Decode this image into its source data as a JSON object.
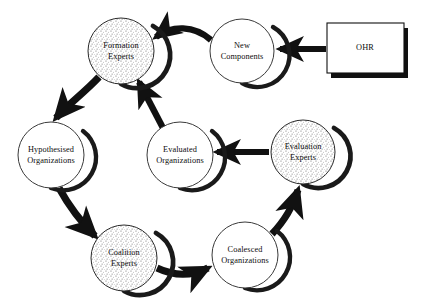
{
  "diagram": {
    "background_color": "#ffffff",
    "stroke_color": "#111111",
    "text_color": "#0d0d0d",
    "nodes": [
      {
        "id": "formation-experts",
        "shape": "circle",
        "style": "stippled-rim",
        "label_line1": "Formation",
        "label_line2": "Experts",
        "cx": 121,
        "cy": 51,
        "r": 33
      },
      {
        "id": "new-components",
        "shape": "circle",
        "style": "plain",
        "label_line1": "New",
        "label_line2": "Components",
        "cx": 242,
        "cy": 51,
        "r": 32
      },
      {
        "id": "ohr",
        "shape": "rectangle",
        "style": "plain",
        "label_line1": "OHR",
        "label_line2": "",
        "x": 327,
        "y": 23,
        "width": 77,
        "height": 50
      },
      {
        "id": "hypothesised-organizations",
        "shape": "circle",
        "style": "plain",
        "label_line1": "Hypothesised",
        "label_line2": "Organizations",
        "cx": 51,
        "cy": 155,
        "r": 33
      },
      {
        "id": "evaluated-organizations",
        "shape": "circle",
        "style": "plain",
        "label_line1": "Evaluated",
        "label_line2": "Organizations",
        "cx": 180,
        "cy": 155,
        "r": 33
      },
      {
        "id": "evaluation-experts",
        "shape": "circle",
        "style": "stippled-rim",
        "label_line1": "Evaluation",
        "label_line2": "Experts",
        "cx": 303,
        "cy": 152,
        "r": 32
      },
      {
        "id": "coalition-experts",
        "shape": "circle",
        "style": "stippled-rim",
        "label_line1": "Coalition",
        "label_line2": "Experts",
        "cx": 124,
        "cy": 258,
        "r": 33
      },
      {
        "id": "coalesced-organizations",
        "shape": "circle",
        "style": "plain",
        "label_line1": "Coalesced",
        "label_line2": "Organizations",
        "cx": 245,
        "cy": 255,
        "r": 33
      }
    ],
    "edges": [
      {
        "id": "ohr-to-new-components",
        "from": "ohr",
        "to": "new-components",
        "kind": "straight"
      },
      {
        "id": "new-components-to-formation-experts",
        "from": "new-components",
        "to": "formation-experts",
        "kind": "curved"
      },
      {
        "id": "formation-experts-to-hypothesised-organizations",
        "from": "formation-experts",
        "to": "hypothesised-organizations",
        "kind": "curved"
      },
      {
        "id": "hypothesised-organizations-to-coalition-experts",
        "from": "hypothesised-organizations",
        "to": "coalition-experts",
        "kind": "curved"
      },
      {
        "id": "coalition-experts-to-coalesced-organizations",
        "from": "coalition-experts",
        "to": "coalesced-organizations",
        "kind": "curved"
      },
      {
        "id": "coalesced-organizations-to-evaluation-experts",
        "from": "coalesced-organizations",
        "to": "evaluation-experts",
        "kind": "curved"
      },
      {
        "id": "evaluation-experts-to-evaluated-organizations",
        "from": "evaluation-experts",
        "to": "evaluated-organizations",
        "kind": "straight"
      },
      {
        "id": "evaluated-organizations-to-formation-experts",
        "from": "evaluated-organizations",
        "to": "formation-experts",
        "kind": "straight"
      }
    ]
  }
}
